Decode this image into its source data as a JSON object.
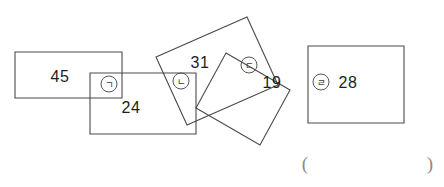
{
  "figure": {
    "background_color": "#ffffff",
    "stroke_color": "#4a4a4a",
    "text_color": "#1d1d1d",
    "width": 444,
    "height": 187
  },
  "shapes": [
    {
      "id": "rect-1",
      "name": "rectangle-45",
      "orientation": "axis-aligned",
      "points": "15,52 122,52 122,98 15,98"
    },
    {
      "id": "rect-2",
      "name": "rectangle-24",
      "orientation": "axis-aligned",
      "points": "90,73 196,73 196,134 90,134"
    },
    {
      "id": "rect-3",
      "name": "rectangle-31",
      "orientation": "tilted",
      "points": "156,57 247,17 278,85 187,125"
    },
    {
      "id": "rect-4",
      "name": "rectangle-19",
      "orientation": "tilted",
      "points": "226,53 290,90 260,145 196,108"
    },
    {
      "id": "rect-5",
      "name": "rectangle-28",
      "orientation": "axis-aligned",
      "points": "308,46 404,46 404,123 308,123"
    }
  ],
  "labels": [
    {
      "id": "label-45",
      "name": "area-label-45",
      "text": "45",
      "x": 60,
      "y": 82
    },
    {
      "id": "label-24",
      "name": "area-label-24",
      "text": "24",
      "x": 131,
      "y": 113
    },
    {
      "id": "label-31",
      "name": "area-label-31",
      "text": "31",
      "x": 200,
      "y": 68
    },
    {
      "id": "label-19",
      "name": "area-label-19",
      "text": "19",
      "x": 272,
      "y": 88
    },
    {
      "id": "label-28",
      "name": "area-label-28",
      "text": "28",
      "x": 348,
      "y": 88
    }
  ],
  "markers": [
    {
      "id": "marker-a",
      "name": "circled-giyeok-marker",
      "glyph": "ㄱ",
      "label": "㈠",
      "cx": 109,
      "cy": 84,
      "r": 8
    },
    {
      "id": "marker-b",
      "name": "circled-nieun-marker",
      "glyph": "ㄴ",
      "label": "㈡",
      "cx": 181,
      "cy": 81,
      "r": 8
    },
    {
      "id": "marker-c",
      "name": "circled-digeut-marker",
      "glyph": "ㄷ",
      "label": "㈢",
      "cx": 249,
      "cy": 65,
      "r": 8
    },
    {
      "id": "marker-d",
      "name": "circled-rieul-marker",
      "glyph": "ㄹ",
      "label": "㈣",
      "cx": 321,
      "cy": 82,
      "r": 8
    }
  ],
  "answer_field": {
    "open_paren": "(",
    "close_paren": ")",
    "value": "",
    "open_x": 305,
    "close_x": 430,
    "y": 170
  }
}
